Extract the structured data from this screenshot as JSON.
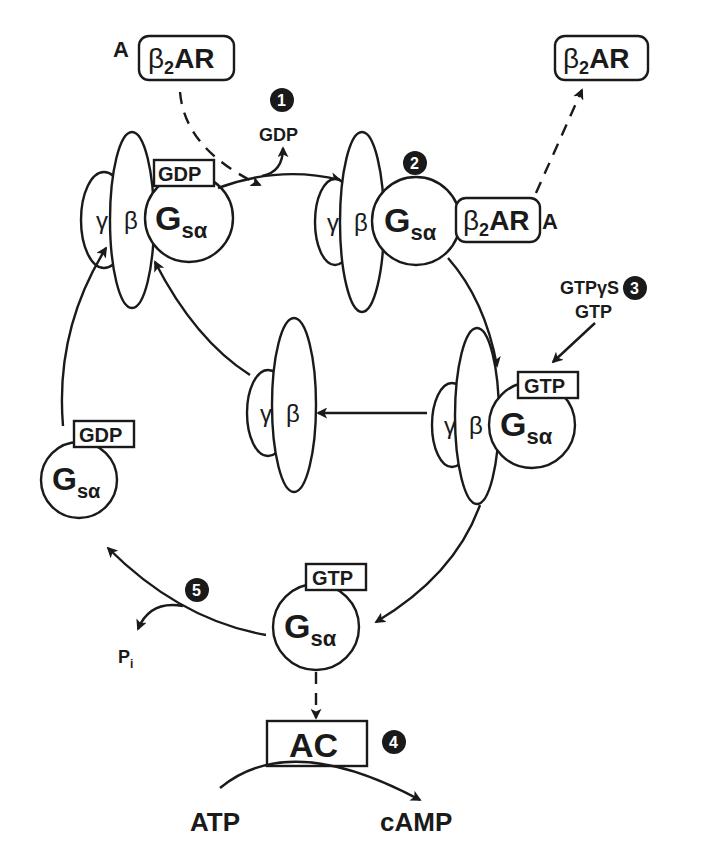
{
  "diagram": {
    "colors": {
      "ink": "#1a1a1a",
      "background": "#ffffff"
    },
    "labels": {
      "agonist": "A",
      "receptor_beta": "β",
      "receptor_sub": "2",
      "receptor_rest": "AR",
      "gamma": "γ",
      "beta": "β",
      "gs_G": "G",
      "gs_sub": "sα",
      "gdp": "GDP",
      "gtp": "GTP",
      "gtpgs": "GTPγS",
      "pi_P": "P",
      "pi_sub": "i",
      "ac": "AC",
      "atp": "ATP",
      "camp": "cAMP"
    },
    "steps": [
      {
        "number": "1",
        "description": "GDP release"
      },
      {
        "number": "2",
        "description": "Receptor–G protein complex"
      },
      {
        "number": "3",
        "description": "GTP / GTPγS binding"
      },
      {
        "number": "4",
        "description": "Adenylyl cyclase activation"
      },
      {
        "number": "5",
        "description": "GTP hydrolysis, Pi release"
      }
    ],
    "nodes": [
      {
        "id": "receptor-free-top-left",
        "text": "A β2AR"
      },
      {
        "id": "receptor-free-top-right",
        "text": "β2AR"
      },
      {
        "id": "heterotrimer-gdp",
        "text": "γ β Gsα GDP"
      },
      {
        "id": "ternary-complex",
        "text": "γ β Gsα β2AR A"
      },
      {
        "id": "heterotrimer-gtp",
        "text": "γ β Gsα GTP"
      },
      {
        "id": "free-beta-gamma",
        "text": "γ β"
      },
      {
        "id": "gsa-gtp",
        "text": "Gsα GTP"
      },
      {
        "id": "gsa-gdp",
        "text": "Gsα GDP"
      },
      {
        "id": "adenylyl-cyclase",
        "text": "AC"
      }
    ]
  }
}
